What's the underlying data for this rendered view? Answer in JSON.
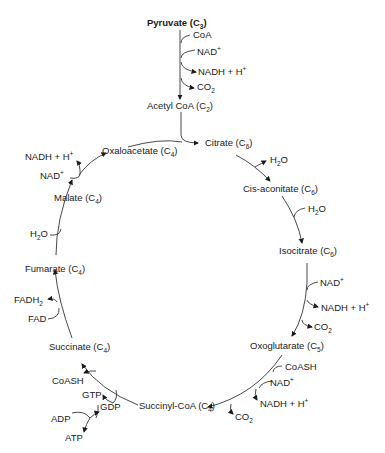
{
  "diagram": {
    "entry": {
      "pyruvate": {
        "name": "Pyruvate",
        "carbons": "3"
      },
      "inputs": [
        "CoA",
        "NAD+"
      ],
      "outputs": [
        "NADH + H+",
        "CO2"
      ],
      "acetyl_coa": {
        "name": "Acetyl CoA",
        "carbons": "2"
      }
    },
    "intermediates": [
      {
        "name": "Citrate",
        "carbons": "6"
      },
      {
        "name": "Cis-aconitate",
        "carbons": "6"
      },
      {
        "name": "Isocitrate",
        "carbons": "6"
      },
      {
        "name": "Oxoglutarate",
        "carbons": "5"
      },
      {
        "name": "Succinyl-CoA",
        "carbons": "4"
      },
      {
        "name": "Succinate",
        "carbons": "4"
      },
      {
        "name": "Fumarate",
        "carbons": "4"
      },
      {
        "name": "Malate",
        "carbons": "4"
      },
      {
        "name": "Oxaloacetate",
        "carbons": "4"
      }
    ],
    "side_labels": {
      "h2o_out_citrate": "H2O",
      "h2o_in_cisaconitate": "H2O",
      "nad_isocitrate": "NAD+",
      "nadh_isocitrate": "NADH + H+",
      "co2_isocitrate": "CO2",
      "coash_oxoglutarate": "CoASH",
      "nad_oxoglutarate": "NAD+",
      "nadh_oxoglutarate": "NADH + H+",
      "co2_oxoglutarate": "CO2",
      "coash_succinyl": "CoASH",
      "gtp": "GTP",
      "gdp": "GDP",
      "adp": "ADP",
      "atp": "ATP",
      "fadh2": "FADH2",
      "fad": "FAD",
      "h2o_fumarate": "H2O",
      "nad_malate": "NAD+",
      "nadh_malate": "NADH + H+"
    }
  }
}
